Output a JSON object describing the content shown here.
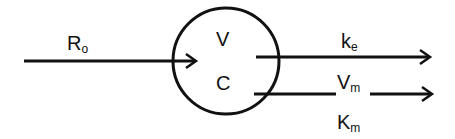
{
  "diagram": {
    "compartment": {
      "volume_label": "V",
      "concentration_label": "C"
    },
    "input": {
      "label_main": "R",
      "label_sub": "o"
    },
    "outputs": [
      {
        "label_main": "k",
        "label_sub": "e"
      },
      {
        "label_main": "V",
        "label_sub": "m",
        "extra_main": "K",
        "extra_sub": "m"
      }
    ]
  }
}
